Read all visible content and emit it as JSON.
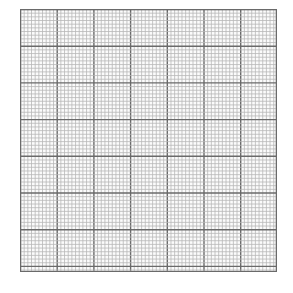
{
  "graph_paper": {
    "description": "Blank graph paper grid",
    "major_columns": 7,
    "major_rows": 7,
    "minor_per_major": 10,
    "colors": {
      "background": "#ffffff",
      "minor_line": "#b8b8b8",
      "major_line": "#6a6a6a"
    }
  }
}
